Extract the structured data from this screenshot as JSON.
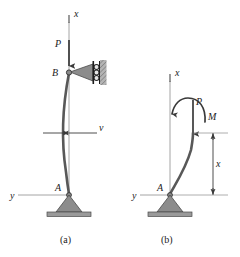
{
  "figure": {
    "type": "engineering-diagram",
    "background_color": "#ffffff",
    "ink_color": "#1c1c1c",
    "member_color": "#585858",
    "support_fill": "#8c8c8c",
    "support_stroke": "#4a4a4a",
    "axis_color": "#909090",
    "dimension_color": "#4a4a4a"
  },
  "panels": [
    {
      "id": "a",
      "caption": "(a)",
      "description": "Pinned-roller column with axial load P and lateral deflection v",
      "labels": {
        "axis_x": "x",
        "axis_y": "y",
        "load": "P",
        "node_top": "B",
        "node_bottom": "A",
        "deflection": "v"
      }
    },
    {
      "id": "b",
      "caption": "(b)",
      "description": "Free-body segment of length x with internal moment M and axial load P",
      "labels": {
        "axis_x": "x",
        "axis_y": "y",
        "load": "P",
        "moment": "M",
        "node_bottom": "A",
        "dimension": "x"
      }
    }
  ]
}
